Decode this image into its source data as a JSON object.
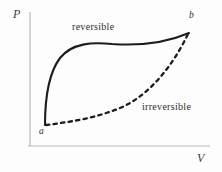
{
  "figure": {
    "type": "pv-diagram",
    "background_color": "#fdfdfd"
  },
  "axes": {
    "y_label": "P",
    "x_label": "V",
    "axis_color": "#b9b9b9",
    "y_axis": {
      "x": 30,
      "y_top": 12,
      "y_bottom": 146
    },
    "x_axis": {
      "y": 146,
      "x_left": 28,
      "x_right": 210
    }
  },
  "points": [
    {
      "id": "a",
      "label": "a",
      "x": 45,
      "y": 124
    },
    {
      "id": "b",
      "label": "b",
      "x": 189,
      "y": 33
    }
  ],
  "curves": [
    {
      "id": "reversible",
      "label": "reversible",
      "style": "solid",
      "color": "#1d1d1d",
      "width": 2.1,
      "path": "M 45 125 C 45 100, 48 74, 60 58 C 72 43, 92 42, 112 44 C 140 46, 168 42, 189 33"
    },
    {
      "id": "irreversible",
      "label": "irreversible",
      "style": "dashed",
      "color": "#1d1d1d",
      "width": 2.3,
      "dash": "3.4 4.2",
      "path": "M 46 125 C 70 122, 96 118, 120 108 C 146 97, 168 72, 184 42 L 188 34"
    }
  ],
  "chart_data": {
    "type": "line",
    "title": "",
    "xlabel": "V",
    "ylabel": "P",
    "grid": false,
    "legend": "inline-annotations",
    "annotations": [
      {
        "text": "reversible",
        "x": 72,
        "y": 22
      },
      {
        "text": "irreversible",
        "x": 142,
        "y": 102
      },
      {
        "text": "a",
        "x": 39,
        "y": 127
      },
      {
        "text": "b",
        "x": 189,
        "y": 11
      },
      {
        "text": "P",
        "x": 13,
        "y": 8
      },
      {
        "text": "V",
        "x": 197,
        "y": 152
      }
    ],
    "series": [
      {
        "name": "reversible",
        "style": "solid",
        "x": [
          45,
          48,
          52,
          57,
          63,
          72,
          85,
          100,
          118,
          138,
          158,
          175,
          189
        ],
        "y": [
          125,
          108,
          90,
          74,
          63,
          53,
          47,
          44,
          44,
          45,
          43,
          39,
          33
        ]
      },
      {
        "name": "irreversible",
        "style": "dashed",
        "x": [
          46,
          58,
          70,
          84,
          98,
          112,
          126,
          140,
          152,
          164,
          174,
          182,
          188
        ],
        "y": [
          125,
          124,
          122,
          119,
          115,
          110,
          103,
          95,
          85,
          72,
          58,
          45,
          34
        ]
      }
    ]
  }
}
